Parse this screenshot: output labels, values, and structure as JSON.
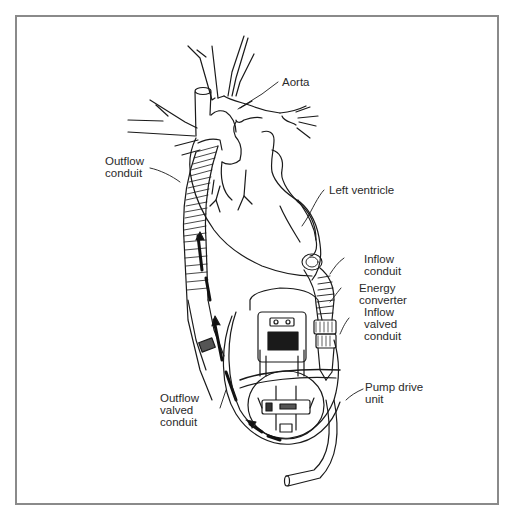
{
  "figure": {
    "labels": {
      "aorta": "Aorta",
      "outflow_conduit": [
        "Outflow",
        "conduit"
      ],
      "left_ventricle": "Left ventricle",
      "inflow_conduit": [
        "Inflow",
        "conduit"
      ],
      "energy_converter": [
        "Energy",
        "converter"
      ],
      "inflow_valved_conduit": [
        "Inflow",
        "valved",
        "conduit"
      ],
      "pump_drive_unit": [
        "Pump drive",
        "unit"
      ],
      "outflow_valved_conduit": [
        "Outflow",
        "valved",
        "conduit"
      ]
    },
    "colors": {
      "line": "#1a1a1a",
      "frame": "#8a8a8a",
      "background": "#ffffff"
    }
  }
}
